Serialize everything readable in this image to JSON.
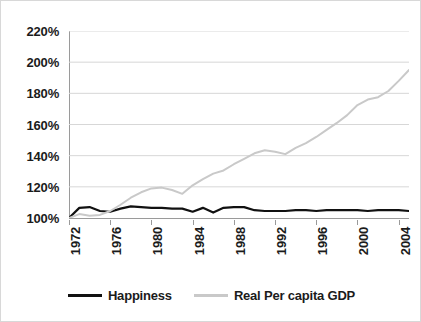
{
  "chart_data": {
    "type": "line",
    "title": "",
    "subtitle": "",
    "xlabel": "",
    "ylabel": "",
    "ylim": [
      100,
      220
    ],
    "xlim": [
      1972,
      2005
    ],
    "grid": true,
    "legend_position": "bottom",
    "y_ticks": [
      "220%",
      "200%",
      "180%",
      "160%",
      "140%",
      "120%",
      "100%"
    ],
    "y_tick_values": [
      220,
      200,
      180,
      160,
      140,
      120,
      100
    ],
    "x_ticks": [
      "1972",
      "1976",
      "1980",
      "1984",
      "1988",
      "1992",
      "1996",
      "2000",
      "2004"
    ],
    "x_tick_values": [
      1972,
      1976,
      1980,
      1984,
      1988,
      1992,
      1996,
      2000,
      2004
    ],
    "x": [
      1972,
      1973,
      1974,
      1975,
      1976,
      1977,
      1978,
      1979,
      1980,
      1981,
      1982,
      1983,
      1984,
      1985,
      1986,
      1987,
      1988,
      1989,
      1990,
      1991,
      1992,
      1993,
      1994,
      1995,
      1996,
      1997,
      1998,
      1999,
      2000,
      2001,
      2002,
      2003,
      2004,
      2005
    ],
    "series": [
      {
        "name": "Happiness",
        "color": "#111111",
        "values": [
          100.0,
          106.5,
          107.0,
          104.5,
          104.0,
          106.0,
          107.5,
          107.0,
          106.5,
          106.5,
          106.0,
          106.0,
          104.0,
          106.5,
          103.5,
          106.5,
          107.0,
          107.0,
          105.0,
          104.5,
          104.5,
          104.5,
          105.0,
          105.0,
          104.5,
          105.0,
          105.0,
          105.0,
          105.0,
          104.5,
          105.0,
          105.0,
          105.0,
          104.5
        ]
      },
      {
        "name": "Real Per capita GDP",
        "color": "#c9c9c9",
        "values": [
          100.0,
          102.5,
          101.5,
          102.0,
          104.5,
          108.5,
          113.0,
          116.5,
          119.0,
          119.5,
          118.0,
          115.5,
          121.0,
          125.0,
          128.5,
          130.5,
          134.5,
          138.0,
          141.5,
          143.5,
          142.5,
          141.0,
          145.0,
          148.0,
          152.0,
          156.5,
          161.0,
          166.0,
          172.5,
          176.0,
          177.5,
          181.5,
          188.0,
          195.0
        ]
      }
    ]
  },
  "legend": {
    "items": [
      {
        "label": "Happiness",
        "swatch": "happiness"
      },
      {
        "label": "Real Per capita GDP",
        "swatch": "gdp"
      }
    ]
  },
  "colors": {
    "happiness_line": "#111111",
    "gdp_line": "#c9c9c9",
    "gridline": "#d7d7d7",
    "axis": "#9a9a9a",
    "text": "#1b1b1b",
    "background": "#ffffff"
  }
}
